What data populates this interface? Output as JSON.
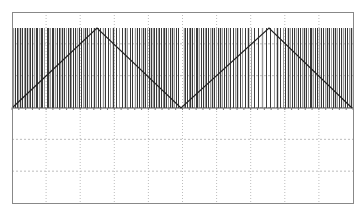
{
  "chart_data": {
    "type": "line",
    "title": "",
    "xlabel": "",
    "ylabel": "",
    "grid": true,
    "legend": "none",
    "plot_area": {
      "left": 12,
      "top": 12,
      "right": 353,
      "bottom": 203
    },
    "grid_divisions": {
      "x": 10,
      "y": 6
    },
    "signal_band": {
      "top": 28,
      "bottom": 108
    },
    "series": [
      {
        "name": "triangle",
        "color": "#222222",
        "points_px": [
          [
            12,
            108
          ],
          [
            97,
            28
          ],
          [
            181,
            108
          ],
          [
            269,
            28
          ],
          [
            352,
            108
          ]
        ],
        "x": [
          0,
          2.5,
          5,
          7.5,
          10
        ],
        "values": [
          0,
          1,
          0,
          1,
          0
        ]
      },
      {
        "name": "pulses",
        "color": "#333333",
        "bar_x_px": [
          13,
          15,
          17,
          18,
          20,
          22,
          24,
          25,
          27,
          29,
          30,
          32,
          34,
          36,
          37,
          39,
          41,
          42,
          44,
          47,
          48,
          50,
          52,
          53,
          55,
          57,
          59,
          60,
          62,
          64,
          66,
          68,
          70,
          71,
          73,
          75,
          77,
          79,
          81,
          83,
          85,
          87,
          89,
          91,
          94,
          96,
          98,
          100,
          103,
          105,
          108,
          110,
          113,
          116,
          119,
          122,
          125,
          127,
          130,
          132,
          135,
          137,
          139,
          141,
          143,
          145,
          147,
          149,
          151,
          153,
          154,
          156,
          158,
          159,
          161,
          163,
          164,
          166,
          168,
          170,
          172,
          174,
          176,
          178,
          184,
          185,
          187,
          189,
          190,
          192,
          194,
          196,
          197,
          199,
          201,
          203,
          205,
          206,
          208,
          210,
          212,
          214,
          216,
          218,
          220,
          222,
          224,
          226,
          228,
          230,
          233,
          235,
          237,
          240,
          242,
          245,
          248,
          251,
          254,
          258,
          262,
          266,
          270,
          274,
          277,
          280,
          283,
          285,
          288,
          290,
          292,
          294,
          296,
          298,
          300,
          302,
          304,
          306,
          308,
          310,
          311,
          313,
          315,
          317,
          319,
          321,
          323,
          325,
          327,
          329,
          331,
          333,
          335,
          337,
          339,
          341,
          343,
          345,
          347,
          349,
          351
        ]
      }
    ]
  },
  "colors": {
    "frame": "#888888",
    "grid": "#bdbdbd",
    "bar_dark": "#3a3a3a",
    "bar_light": "#9a9a9a",
    "line": "#222222",
    "background": "#ffffff"
  }
}
